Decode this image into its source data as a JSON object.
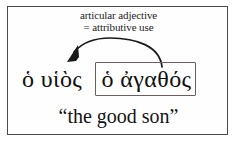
{
  "figure": {
    "type": "greek-grammar-diagram",
    "background_color": "#ffffff",
    "frame_color": "#4a4a4a",
    "box_color": "#6b5f5c",
    "text_color": "#101010",
    "arrow_color": "#1a1a1a"
  },
  "annotation": {
    "line1": "articular adjective",
    "line2": "= attributive use"
  },
  "arrow": {
    "name": "curved-pointer-arrow",
    "direction": "right-to-left",
    "head_shape": "filled-triangle"
  },
  "greek": {
    "lead_phrase": "ὁ υἱὸς",
    "boxed_phrase": "ὁ ἀγαθός"
  },
  "gloss": {
    "text": "“the good son”"
  }
}
